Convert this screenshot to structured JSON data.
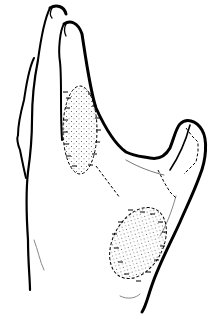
{
  "figure": {
    "style": "black line illustration",
    "colors": {
      "line": "#000000",
      "background": "#ffffff",
      "stipple": "#555555"
    },
    "grafts": [
      {
        "name": "upper-palm-graft",
        "cx": 80,
        "cy": 130,
        "rx": 18,
        "ry": 45
      },
      {
        "name": "lower-palm-graft",
        "cx": 138,
        "cy": 243,
        "rx": 25,
        "ry": 38
      }
    ],
    "suture_lines": [
      "upper-graft-border",
      "connecting-line",
      "lower-graft-border",
      "thumb-line"
    ]
  }
}
